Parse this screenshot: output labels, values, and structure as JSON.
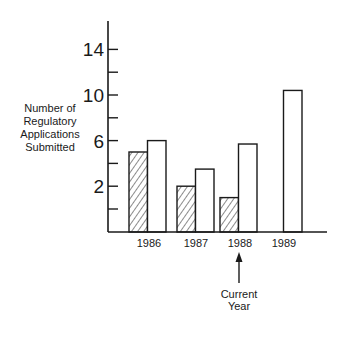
{
  "chart_data": {
    "type": "bar",
    "title": "",
    "xlabel": "",
    "ylabel": "Number of Regulatory Applications Submitted",
    "ylabel_lines": [
      "Number of",
      "Regulatory",
      "Applications",
      "Submitted"
    ],
    "categories": [
      "1986",
      "1987",
      "1988",
      "1989"
    ],
    "series": [
      {
        "name": "hatched",
        "pattern": "diagonal-hatch",
        "values": [
          5,
          2,
          1,
          null
        ]
      },
      {
        "name": "open",
        "pattern": "white",
        "values": [
          6,
          3.5,
          5.7,
          10.4
        ]
      }
    ],
    "yticks": [
      0,
      2,
      4,
      6,
      8,
      10,
      12,
      14
    ],
    "ytick_labels": [
      "2",
      "6",
      "10",
      "14"
    ],
    "ylim": [
      -2,
      16
    ],
    "grid": false,
    "legend": null,
    "annotations": [
      {
        "text_lines": [
          "Current",
          "Year"
        ],
        "points_to": "1988",
        "type": "arrow-up"
      }
    ]
  },
  "colors": {
    "ink": "#1a1a1a",
    "background": "#ffffff"
  }
}
